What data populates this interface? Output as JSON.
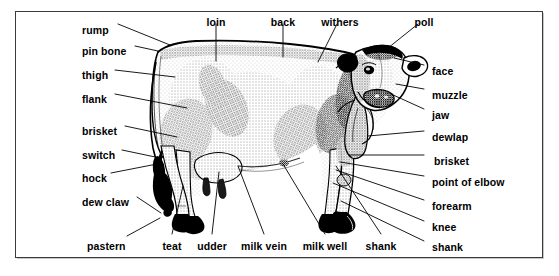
{
  "figure": {
    "frame_color": "#3a3a3a",
    "background_color": "#ffffff",
    "ink_color": "#000000"
  },
  "labels": {
    "left": [
      {
        "text": "rump",
        "x": 82,
        "y": 25
      },
      {
        "text": "pin bone",
        "x": 82,
        "y": 46
      },
      {
        "text": "thigh",
        "x": 82,
        "y": 70
      },
      {
        "text": "flank",
        "x": 82,
        "y": 94
      },
      {
        "text": "brisket",
        "x": 82,
        "y": 126
      },
      {
        "text": "switch",
        "x": 82,
        "y": 150
      },
      {
        "text": "hock",
        "x": 82,
        "y": 173
      },
      {
        "text": "dew claw",
        "x": 82,
        "y": 197
      },
      {
        "text": "pastern",
        "x": 87,
        "y": 241
      }
    ],
    "top": [
      {
        "text": "loin",
        "x": 216,
        "y": 17
      },
      {
        "text": "back",
        "x": 283,
        "y": 17
      },
      {
        "text": "withers",
        "x": 340,
        "y": 17
      },
      {
        "text": "poll",
        "x": 424,
        "y": 17
      }
    ],
    "bottom": [
      {
        "text": "teat",
        "x": 172,
        "y": 241
      },
      {
        "text": "udder",
        "x": 212,
        "y": 241
      },
      {
        "text": "milk vein",
        "x": 264,
        "y": 241
      },
      {
        "text": "milk well",
        "x": 325,
        "y": 241
      },
      {
        "text": "shank",
        "x": 381,
        "y": 241
      }
    ],
    "right": [
      {
        "text": "face",
        "x": 432,
        "y": 66
      },
      {
        "text": "muzzle",
        "x": 432,
        "y": 90
      },
      {
        "text": "jaw",
        "x": 432,
        "y": 110
      },
      {
        "text": "dewlap",
        "x": 432,
        "y": 132
      },
      {
        "text": "brisket",
        "x": 434,
        "y": 156
      },
      {
        "text": "point of elbow",
        "x": 432,
        "y": 177
      },
      {
        "text": "forearm",
        "x": 432,
        "y": 201
      },
      {
        "text": "knee",
        "x": 432,
        "y": 222
      },
      {
        "text": "shank",
        "x": 432,
        "y": 242
      }
    ]
  },
  "leaders": {
    "left": [
      {
        "name": "rump",
        "x1": 118,
        "y1": 24,
        "x2": 170,
        "y2": 45
      },
      {
        "name": "pin-bone",
        "x1": 135,
        "y1": 46,
        "x2": 158,
        "y2": 51
      },
      {
        "name": "thigh",
        "x1": 115,
        "y1": 70,
        "x2": 175,
        "y2": 77
      },
      {
        "name": "flank",
        "x1": 115,
        "y1": 94,
        "x2": 187,
        "y2": 108
      },
      {
        "name": "brisket",
        "x1": 125,
        "y1": 126,
        "x2": 177,
        "y2": 137
      },
      {
        "name": "switch",
        "x1": 122,
        "y1": 150,
        "x2": 160,
        "y2": 158
      },
      {
        "name": "hock",
        "x1": 111,
        "y1": 173,
        "x2": 157,
        "y2": 164
      },
      {
        "name": "dew-claw",
        "x1": 137,
        "y1": 197,
        "x2": 161,
        "y2": 213
      },
      {
        "name": "pastern",
        "x1": 127,
        "y1": 236,
        "x2": 160,
        "y2": 218
      }
    ],
    "top": [
      {
        "name": "loin",
        "x1": 216,
        "y1": 24,
        "x2": 216,
        "y2": 61
      },
      {
        "name": "back",
        "x1": 283,
        "y1": 24,
        "x2": 283,
        "y2": 57
      },
      {
        "name": "withers",
        "x1": 337,
        "y1": 24,
        "x2": 318,
        "y2": 62
      },
      {
        "name": "poll",
        "x1": 418,
        "y1": 24,
        "x2": 388,
        "y2": 48
      }
    ],
    "bottom": [
      {
        "name": "teat",
        "x1": 172,
        "y1": 234,
        "x2": 183,
        "y2": 186
      },
      {
        "name": "udder",
        "x1": 212,
        "y1": 234,
        "x2": 219,
        "y2": 172
      },
      {
        "name": "milk-vein",
        "x1": 264,
        "y1": 234,
        "x2": 238,
        "y2": 166
      },
      {
        "name": "milk-well",
        "x1": 325,
        "y1": 234,
        "x2": 283,
        "y2": 164
      },
      {
        "name": "shank",
        "x1": 381,
        "y1": 234,
        "x2": 336,
        "y2": 166
      }
    ],
    "right": [
      {
        "name": "face",
        "x1": 424,
        "y1": 65,
        "x2": 394,
        "y2": 58
      },
      {
        "name": "muzzle",
        "x1": 424,
        "y1": 89,
        "x2": 396,
        "y2": 84
      },
      {
        "name": "jaw",
        "x1": 424,
        "y1": 109,
        "x2": 391,
        "y2": 94
      },
      {
        "name": "dewlap",
        "x1": 424,
        "y1": 131,
        "x2": 368,
        "y2": 136
      },
      {
        "name": "brisket",
        "x1": 424,
        "y1": 155,
        "x2": 349,
        "y2": 155
      },
      {
        "name": "point-of-elbow",
        "x1": 424,
        "y1": 176,
        "x2": 340,
        "y2": 162
      },
      {
        "name": "forearm",
        "x1": 424,
        "y1": 200,
        "x2": 336,
        "y2": 170
      },
      {
        "name": "knee",
        "x1": 424,
        "y1": 221,
        "x2": 333,
        "y2": 183
      },
      {
        "name": "shank",
        "x1": 424,
        "y1": 241,
        "x2": 341,
        "y2": 201
      }
    ]
  }
}
